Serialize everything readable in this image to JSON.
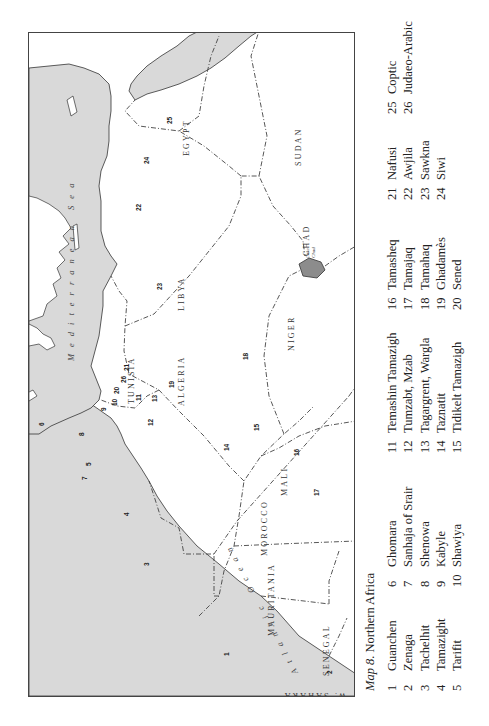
{
  "figure": {
    "caption_label": "Map 8",
    "caption_title": ". Northern Africa"
  },
  "map": {
    "seas": {
      "mediterranean": "Mediterranean Sea",
      "atlantic": "Atlantic Ocean"
    },
    "lake": {
      "line1": "Lake",
      "line2": "Chad"
    },
    "countries": [
      "W. SAHARA",
      "MOROCCO",
      "ALGERIA",
      "TUNISIA",
      "LIBYA",
      "EGYPT",
      "SUDAN",
      "CHAD",
      "NIGER",
      "MALI",
      "MAURITANIA",
      "SENEGAL"
    ],
    "markers": [
      "1",
      "2",
      "3",
      "4",
      "5",
      "6",
      "7",
      "8",
      "9",
      "10",
      "11",
      "12",
      "13",
      "14",
      "15",
      "16",
      "17",
      "18",
      "19",
      "20",
      "21",
      "22",
      "23",
      "24",
      "25",
      "26"
    ],
    "colors": {
      "water": "#d9d9d9",
      "land": "#ffffff",
      "lake": "#8c8c8c",
      "border": "#444444"
    }
  },
  "legend": {
    "columns": [
      [
        {
          "n": "1",
          "name": "Guanchen"
        },
        {
          "n": "2",
          "name": "Zenaga"
        },
        {
          "n": "3",
          "name": "Tachelhit"
        },
        {
          "n": "4",
          "name": "Tamazight"
        },
        {
          "n": "5",
          "name": "Tarifit"
        }
      ],
      [
        {
          "n": "6",
          "name": "Ghomara"
        },
        {
          "n": "7",
          "name": "Sanhaja of Srair"
        },
        {
          "n": "8",
          "name": "Shenowa"
        },
        {
          "n": "9",
          "name": "Kabyle"
        },
        {
          "n": "10",
          "name": "Shawiya"
        }
      ],
      [
        {
          "n": "11",
          "name": "Temashin Tamazigh"
        },
        {
          "n": "12",
          "name": "Tumzabt, Mzab"
        },
        {
          "n": "13",
          "name": "Tagargrent, Wargla"
        },
        {
          "n": "14",
          "name": "Taznatit"
        },
        {
          "n": "15",
          "name": "Tidikelt Tamazigh"
        }
      ],
      [
        {
          "n": "16",
          "name": "Tamasheq"
        },
        {
          "n": "17",
          "name": "Tamajaq"
        },
        {
          "n": "18",
          "name": "Tamahaq"
        },
        {
          "n": "19",
          "name": "Ghadamès"
        },
        {
          "n": "20",
          "name": "Sened"
        }
      ],
      [
        {
          "n": "21",
          "name": "Nafusi"
        },
        {
          "n": "22",
          "name": "Awjila"
        },
        {
          "n": "23",
          "name": "Sawkna"
        },
        {
          "n": "24",
          "name": "Siwi"
        }
      ],
      [
        {
          "n": "25",
          "name": "Coptic"
        },
        {
          "n": "26",
          "name": "Judaeo-Arabic"
        }
      ]
    ]
  }
}
